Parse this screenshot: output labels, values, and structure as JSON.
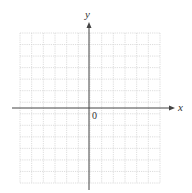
{
  "diagram": {
    "type": "coordinate-plane",
    "x_axis_label": "x",
    "y_axis_label": "y",
    "origin_label": "0",
    "grid": {
      "columns": 12,
      "rows": 13,
      "left": 20,
      "top": 33,
      "right": 160,
      "bottom": 183,
      "color": "#d4d4d4",
      "style": "dotted"
    },
    "axes": {
      "origin_x": 89,
      "origin_y": 108,
      "x_start": 12,
      "x_end": 175,
      "y_start": 22,
      "y_end": 190,
      "color": "#444444"
    }
  }
}
